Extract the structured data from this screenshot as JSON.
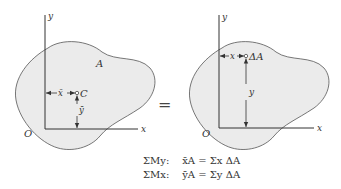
{
  "colors": {
    "region_fill": "#ebebeb",
    "outline": "#555555",
    "axis": "#333333",
    "text": "#333333"
  },
  "left_diagram": {
    "axis_y_label": "y",
    "axis_x_label": "x",
    "origin_label": "O",
    "area_label": "A",
    "centroid_label": "C",
    "xbar_label": "x̄",
    "ybar_label": "ȳ"
  },
  "equals_sign": "=",
  "right_diagram": {
    "axis_y_label": "y",
    "axis_x_label": "x",
    "origin_label": "O",
    "element_label": "ΔA",
    "x_label": "x",
    "y_label": "y"
  },
  "equations": [
    {
      "head": "ΣMy:",
      "body": "x̄A = Σx ΔA"
    },
    {
      "head": "ΣMx:",
      "body": "ȳA = Σy ΔA"
    }
  ]
}
